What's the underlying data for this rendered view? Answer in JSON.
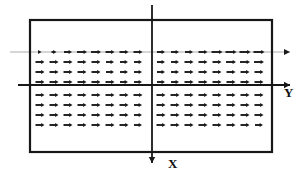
{
  "figure": {
    "title": "",
    "background_color": "#ffffff",
    "ink_color": "#1a1a1a",
    "width": 306,
    "height": 175
  },
  "domain_box": {
    "name": "rectangular-domain-boundary",
    "x": 30,
    "y": 20,
    "width": 242,
    "height": 132,
    "stroke_width": 2.2,
    "color": "#171717"
  },
  "axes": {
    "vertical": {
      "label": "X",
      "label_x": 168,
      "label_y": 168,
      "line_x": 152,
      "y_start": 5,
      "y_end": 163,
      "arrow_direction": "down",
      "stroke_width": 1.8,
      "color": "#171717"
    },
    "horizontal": {
      "label": "Y",
      "label_x": 284,
      "label_y": 97,
      "line_y": 85,
      "x_start": 18,
      "x_end": 290,
      "arrow_direction": "right",
      "stroke_width": 1.8,
      "color": "#171717"
    },
    "upper_guide": {
      "label": "",
      "line_y": 52,
      "x_start": 10,
      "x_end": 290,
      "arrow_direction": "right",
      "stroke_width": 1.0,
      "color": "#4a4a4a",
      "note": "faint upper streamline with arrowhead"
    }
  },
  "chart_data": {
    "type": "quiver",
    "title": "",
    "xlabel": "Y",
    "ylabel": "X",
    "grid": false,
    "legend": null,
    "annotations": [
      "X",
      "Y"
    ],
    "vector_direction": "all arrows point in +Y (right)",
    "row_y": [
      52,
      62,
      72,
      82,
      95,
      105,
      115,
      125
    ],
    "left_block": {
      "x_start": 40,
      "x_step": 14,
      "columns": 8
    },
    "right_block": {
      "x_start": 161,
      "x_step": 14,
      "columns": 8
    },
    "arrow_lengths_by_row_left": [
      [
        3,
        5,
        8,
        10,
        10,
        9,
        9,
        9
      ],
      [
        9,
        9,
        9,
        9,
        9,
        8,
        8,
        8
      ],
      [
        9,
        9,
        9,
        9,
        9,
        8,
        8,
        8
      ],
      [
        9,
        9,
        9,
        9,
        9,
        9,
        8,
        8
      ],
      [
        9,
        9,
        9,
        9,
        9,
        9,
        9,
        9
      ],
      [
        9,
        9,
        9,
        9,
        9,
        9,
        9,
        8
      ],
      [
        9,
        9,
        9,
        9,
        9,
        9,
        9,
        8
      ],
      [
        9,
        9,
        9,
        9,
        9,
        9,
        9,
        8
      ]
    ],
    "arrow_lengths_by_row_right": [
      [
        8,
        8,
        8,
        9,
        11,
        11,
        11,
        11
      ],
      [
        8,
        8,
        9,
        9,
        9,
        10,
        10,
        10
      ],
      [
        8,
        8,
        9,
        9,
        9,
        9,
        9,
        9
      ],
      [
        8,
        8,
        9,
        9,
        9,
        9,
        9,
        9
      ],
      [
        9,
        9,
        9,
        9,
        9,
        9,
        9,
        9
      ],
      [
        9,
        9,
        9,
        9,
        9,
        9,
        9,
        9
      ],
      [
        9,
        9,
        9,
        9,
        9,
        9,
        9,
        9
      ],
      [
        9,
        9,
        9,
        9,
        9,
        9,
        9,
        8
      ]
    ]
  }
}
